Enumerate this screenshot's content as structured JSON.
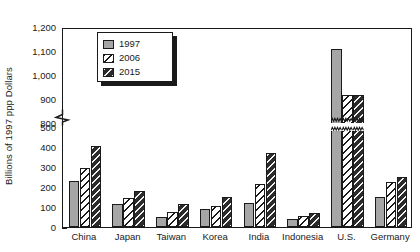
{
  "chart_data": {
    "type": "bar",
    "title": "",
    "xlabel": "",
    "ylabel": "Billions of 1997 ppp Dollars",
    "categories": [
      "China",
      "Japan",
      "Taiwan",
      "Korea",
      "India",
      "Indonesia",
      "U.S.",
      "Germany"
    ],
    "series": [
      {
        "name": "1997",
        "values": [
          230,
          115,
          50,
          88,
          122,
          38,
          1110,
          150
        ]
      },
      {
        "name": "2006",
        "values": [
          295,
          145,
          75,
          103,
          215,
          55,
          918,
          225
        ]
      },
      {
        "name": "2015",
        "values": [
          405,
          180,
          115,
          150,
          370,
          68,
          915,
          248
        ]
      }
    ],
    "ytick_labels": [
      "0",
      "100",
      "200",
      "300",
      "400",
      "500",
      "800",
      "900",
      "1,000",
      "1,100",
      "1,200"
    ],
    "ylim": [
      0,
      1200
    ],
    "axis_break": {
      "from": 500,
      "to": 800,
      "present": true
    },
    "grid": false,
    "legend_position": "top-left",
    "legend_entries": [
      "1997",
      "2006",
      "2015"
    ],
    "colors": {
      "series_1997": "#a6a6a6",
      "series_2006": "#ffffff",
      "series_2015": "#2b2b2b",
      "axis": "#1a1a1a",
      "background": "#ffffff"
    }
  }
}
